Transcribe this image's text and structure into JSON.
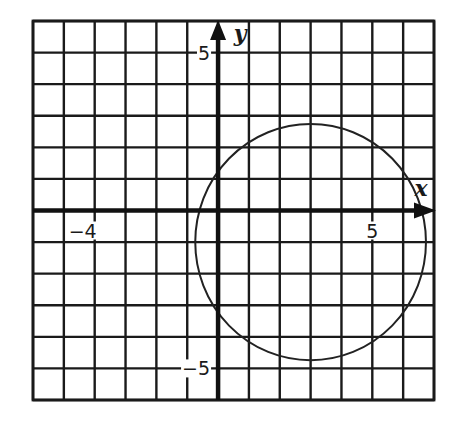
{
  "chart_data": {
    "type": "line",
    "title": "",
    "xlabel": "x",
    "ylabel": "y",
    "xlim": [
      -6,
      7
    ],
    "ylim": [
      -6,
      6
    ],
    "grid": true,
    "grid_step": 1,
    "legend": null,
    "tick_labels": {
      "x": [
        {
          "value": -4,
          "label": "−4"
        },
        {
          "value": 5,
          "label": "5"
        }
      ],
      "y": [
        {
          "value": 5,
          "label": "5"
        },
        {
          "value": -5,
          "label": "−5"
        }
      ]
    },
    "series": [
      {
        "name": "circle",
        "shape": "circle",
        "center": [
          3,
          -1
        ],
        "radius": 3.74,
        "equation": "(x - 3)^2 + (y + 1)^2 = 14"
      }
    ]
  },
  "colors": {
    "background": "#ffffff",
    "grid": "#1a1a1a",
    "axis": "#111111",
    "curve": "#222222"
  }
}
